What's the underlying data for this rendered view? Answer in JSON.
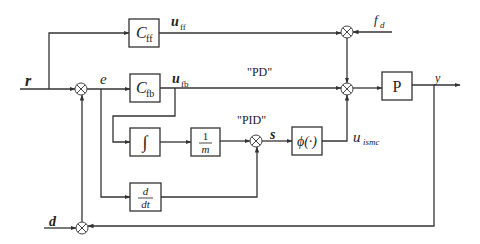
{
  "diagram": {
    "colors": {
      "line": "#333333",
      "background": "#ffffff",
      "text": "#222222"
    },
    "blocks": {
      "cff": {
        "main": "C",
        "sub": "ff"
      },
      "cfb": {
        "main": "C",
        "sub": "fb"
      },
      "integral": {
        "symbol": "∫"
      },
      "inv_m": {
        "num": "1",
        "den": "m"
      },
      "deriv": {
        "num": "d",
        "den": "dt"
      },
      "phi": {
        "label": "ϕ(·)"
      },
      "plant": {
        "label": "P"
      }
    },
    "signals": {
      "r": "r",
      "e": "e",
      "u_ff": {
        "main": "u",
        "sub": "ff"
      },
      "u_fb": {
        "main": "u",
        "sub": "fb"
      },
      "s": "s",
      "u_ismc": {
        "main": "u",
        "sub": "ismc"
      },
      "f_d": {
        "main": "f",
        "sub": "d"
      },
      "y": "y",
      "d": "d"
    },
    "annotations": {
      "pd": "\"PD\"",
      "pid": "\"PID\""
    }
  }
}
